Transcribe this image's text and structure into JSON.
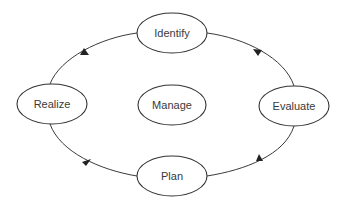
{
  "diagram": {
    "type": "cycle",
    "direction": "clockwise",
    "center_node": {
      "id": "manage",
      "label": "Manage"
    },
    "nodes": [
      {
        "id": "identify",
        "label": "Identify",
        "position": "top"
      },
      {
        "id": "evaluate",
        "label": "Evaluate",
        "position": "right"
      },
      {
        "id": "plan",
        "label": "Plan",
        "position": "bottom"
      },
      {
        "id": "realize",
        "label": "Realize",
        "position": "left"
      }
    ],
    "edges": [
      {
        "from": "identify",
        "to": "evaluate"
      },
      {
        "from": "evaluate",
        "to": "plan"
      },
      {
        "from": "plan",
        "to": "realize"
      },
      {
        "from": "realize",
        "to": "identify"
      }
    ],
    "colors": {
      "stroke": "#333333",
      "text": "#3a3a3a",
      "fill": "#ffffff"
    }
  }
}
